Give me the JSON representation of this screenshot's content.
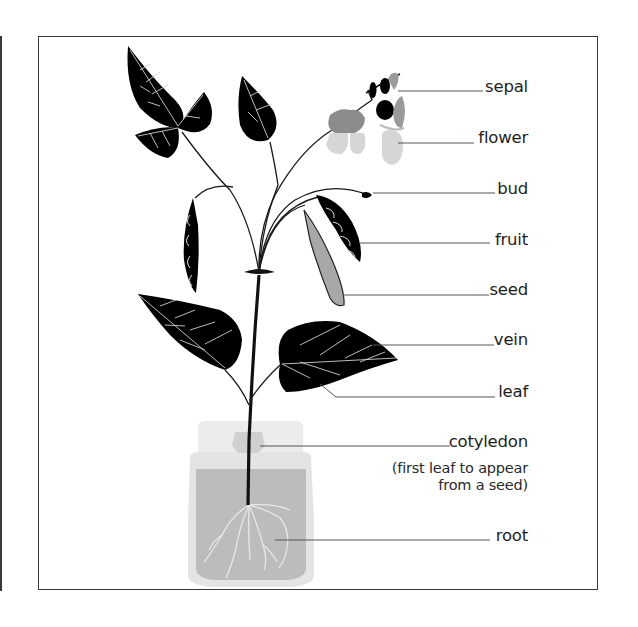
{
  "diagram": {
    "labels": [
      {
        "id": "sepal",
        "text": "sepal"
      },
      {
        "id": "flower",
        "text": "flower"
      },
      {
        "id": "bud",
        "text": "bud"
      },
      {
        "id": "fruit",
        "text": "fruit"
      },
      {
        "id": "seed",
        "text": "seed"
      },
      {
        "id": "vein",
        "text": "vein"
      },
      {
        "id": "leaf",
        "text": "leaf"
      },
      {
        "id": "cotyledon",
        "text": "cotyledon"
      },
      {
        "id": "root",
        "text": "root"
      }
    ],
    "cotyledon_note": {
      "line1": "(first leaf to appear",
      "line2": "from a seed)"
    },
    "colors": {
      "leaf": "#000000",
      "vein": "#d9d9d9",
      "flower_dark": "#8c8c8c",
      "flower_light": "#d4d4d4",
      "seed_pod": "#a6a6a6",
      "jar_glass": "#e6e6e6",
      "jar_soil": "#bdbdbd",
      "leader_line": "#555555",
      "frame": "#3a3a3a"
    }
  }
}
